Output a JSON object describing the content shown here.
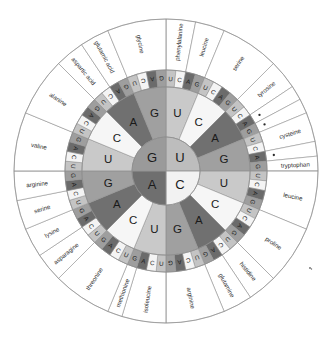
{
  "colors": {
    "background": "#ffffff",
    "outline": "#8a8a8a",
    "text": "#1a1a1a",
    "base_U": "#bdbdbd",
    "base_C": "#f2f2f2",
    "base_A": "#6f6f6f",
    "base_G": "#9a9a9a",
    "base_U_r2": "#c9c9c9",
    "base_C_r2": "#f6f6f6",
    "base_A_r2": "#707070",
    "base_G_r2": "#a0a0a0",
    "base_U_r3": "#c4c4c4",
    "base_C_r3": "#f4f4f4",
    "base_A_r3": "#6b6b6b",
    "base_G_r3": "#9e9e9e"
  },
  "rings": {
    "ring1_label": "first base",
    "ring2_label": "second base",
    "ring3_label": "third base",
    "ring4_label": "amino acid",
    "ring1": [
      "U",
      "C",
      "A",
      "G"
    ],
    "ring2_pattern": [
      "U",
      "C",
      "A",
      "G"
    ],
    "ring3_pattern": [
      "U",
      "C",
      "A",
      "G"
    ],
    "ring1_quadrants": [
      {
        "base": "U",
        "start_deg": 0,
        "end_deg": 90
      },
      {
        "base": "C",
        "start_deg": 90,
        "end_deg": 180
      },
      {
        "base": "A",
        "start_deg": 180,
        "end_deg": 270
      },
      {
        "base": "G",
        "start_deg": 270,
        "end_deg": 360
      }
    ],
    "ring2_sequence": [
      "U",
      "C",
      "A",
      "G",
      "U",
      "C",
      "A",
      "G",
      "U",
      "C",
      "A",
      "G",
      "U",
      "C",
      "A",
      "G"
    ],
    "ring3_sequence": [
      "U",
      "C",
      "A",
      "G",
      "U",
      "C",
      "A",
      "G",
      "U",
      "C",
      "A",
      "G",
      "U",
      "C",
      "A",
      "G",
      "U",
      "C",
      "A",
      "G",
      "U",
      "C",
      "A",
      "G",
      "U",
      "C",
      "A",
      "G",
      "U",
      "C",
      "A",
      "G",
      "U",
      "C",
      "A",
      "G",
      "U",
      "C",
      "A",
      "G",
      "U",
      "C",
      "A",
      "G",
      "U",
      "C",
      "A",
      "G",
      "U",
      "C",
      "A",
      "G",
      "U",
      "C",
      "A",
      "G",
      "U",
      "C",
      "A",
      "G",
      "U",
      "C",
      "A",
      "G"
    ]
  },
  "amino_acids": [
    {
      "index": 0,
      "label": "phenylalanine",
      "codons": [
        "UUU",
        "UUC"
      ],
      "stop": false
    },
    {
      "index": 1,
      "label": "leucine",
      "codons": [
        "UUA",
        "UUG"
      ],
      "stop": false
    },
    {
      "index": 2,
      "label": "serine",
      "codons": [
        "UCU",
        "UCC",
        "UCA",
        "UCG"
      ],
      "stop": false
    },
    {
      "index": 3,
      "label": "tyrosine",
      "codons": [
        "UAU",
        "UAC"
      ],
      "stop": false
    },
    {
      "index": 4,
      "label": "",
      "codons": [
        "UAA"
      ],
      "stop": true
    },
    {
      "index": 5,
      "label": "",
      "codons": [
        "UAG"
      ],
      "stop": true
    },
    {
      "index": 6,
      "label": "cysteine",
      "codons": [
        "UGU",
        "UGC"
      ],
      "stop": false
    },
    {
      "index": 7,
      "label": "",
      "codons": [
        "UGA"
      ],
      "stop": true
    },
    {
      "index": 8,
      "label": "tryptophan",
      "codons": [
        "UGG"
      ],
      "stop": false
    },
    {
      "index": 9,
      "label": "leucine",
      "codons": [
        "CUU",
        "CUC",
        "CUA",
        "CUG"
      ],
      "stop": false
    },
    {
      "index": 10,
      "label": "proline",
      "codons": [
        "CCU",
        "CCC",
        "CCA",
        "CCG"
      ],
      "stop": false
    },
    {
      "index": 11,
      "label": "histidine",
      "codons": [
        "CAU",
        "CAC"
      ],
      "stop": false
    },
    {
      "index": 12,
      "label": "glutamine",
      "codons": [
        "CAA",
        "CAG"
      ],
      "stop": false
    },
    {
      "index": 13,
      "label": "arginine",
      "codons": [
        "CGU",
        "CGC",
        "CGA",
        "CGG"
      ],
      "stop": false
    },
    {
      "index": 14,
      "label": "isoleucine",
      "codons": [
        "AUU",
        "AUC",
        "AUA"
      ],
      "stop": false
    },
    {
      "index": 15,
      "label": "methionine",
      "codons": [
        "AUG"
      ],
      "stop": false
    },
    {
      "index": 16,
      "label": "threonine",
      "codons": [
        "ACU",
        "ACC",
        "ACA",
        "ACG"
      ],
      "stop": false
    },
    {
      "index": 17,
      "label": "asparagine",
      "codons": [
        "AAU",
        "AAC"
      ],
      "stop": false
    },
    {
      "index": 18,
      "label": "lysine",
      "codons": [
        "AAA",
        "AAG"
      ],
      "stop": false
    },
    {
      "index": 19,
      "label": "serine",
      "codons": [
        "AGU",
        "AGC"
      ],
      "stop": false
    },
    {
      "index": 20,
      "label": "arginine",
      "codons": [
        "AGA",
        "AGG"
      ],
      "stop": false
    },
    {
      "index": 21,
      "label": "valine",
      "codons": [
        "GUU",
        "GUC",
        "GUA",
        "GUG"
      ],
      "stop": false
    },
    {
      "index": 22,
      "label": "alanine",
      "codons": [
        "GCU",
        "GCC",
        "GCA",
        "GCG"
      ],
      "stop": false
    },
    {
      "index": 23,
      "label": "aspartic acid",
      "codons": [
        "GAU",
        "GAC"
      ],
      "stop": false
    },
    {
      "index": 24,
      "label": "glutamic acid",
      "codons": [
        "GAA",
        "GAG"
      ],
      "stop": false
    },
    {
      "index": 25,
      "label": "glycine",
      "codons": [
        "GGU",
        "GGC",
        "GGA",
        "GGG"
      ],
      "stop": false
    }
  ],
  "outer_label_order_clockwise_from_top": [
    "phenylalanine",
    "leucine",
    "serine",
    "tyrosine",
    "stop",
    "stop",
    "cysteine",
    "stop",
    "tryptophan",
    "leucine",
    "proline",
    "histidine",
    "glutamine",
    "arginine",
    "isoleucine",
    "methionine",
    "threonine",
    "asparagine",
    "lysine",
    "serine",
    "arginine",
    "valine",
    "alanine",
    "aspartic acid",
    "glutamic acid",
    "glycine"
  ],
  "stop_marker": "•",
  "ring1_letters_rendered": {
    "top_right": "U",
    "top_left": "G",
    "bottom_left": "A",
    "bottom_right": "C"
  }
}
